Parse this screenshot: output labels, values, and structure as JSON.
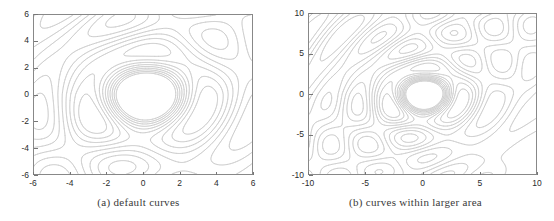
{
  "figure": {
    "background_color": "#ffffff",
    "contour_color": "#c4c4c4",
    "axis_color": "#888888",
    "tick_color": "#777777",
    "text_color": "#2b2b2b"
  },
  "panels": [
    {
      "id": "a",
      "caption": "(a) default curves",
      "chart_data": {
        "type": "line",
        "title": "(a) default curves",
        "subtitle": "",
        "plot_kind": "contour",
        "xlabel": "",
        "ylabel": "",
        "xlim": [
          -6,
          6
        ],
        "ylim": [
          -6,
          6
        ],
        "xticks": [
          -6,
          -4,
          -2,
          0,
          2,
          4,
          6
        ],
        "yticks": [
          -6,
          -4,
          -2,
          0,
          2,
          4,
          6
        ],
        "xtick_labels": [
          "-6",
          "-4",
          "-2",
          "0",
          "2",
          "4",
          "6"
        ],
        "ytick_labels": [
          "-6",
          "-4",
          "-2",
          "0",
          "2",
          "4",
          "6"
        ],
        "grid": false,
        "legend": false,
        "legend_position": "none",
        "n_contour_levels": 10,
        "contour_levels": [
          -0.8,
          -0.6,
          -0.4,
          -0.2,
          0.0,
          0.2,
          0.4,
          0.6,
          0.8,
          1.0
        ],
        "series": [
          {
            "name": "contour lines",
            "values": []
          }
        ],
        "annotations": []
      }
    },
    {
      "id": "b",
      "caption": "(b) curves within larger area",
      "chart_data": {
        "type": "line",
        "title": "(b) curves within larger area",
        "subtitle": "",
        "plot_kind": "contour",
        "xlabel": "",
        "ylabel": "",
        "xlim": [
          -10,
          10
        ],
        "ylim": [
          -10,
          10
        ],
        "xticks": [
          -10,
          -5,
          0,
          5,
          10
        ],
        "yticks": [
          -10,
          -5,
          0,
          5,
          10
        ],
        "xtick_labels": [
          "-10",
          "-5",
          "0",
          "5",
          "10"
        ],
        "ytick_labels": [
          "-10",
          "-5",
          "0",
          "5",
          "10"
        ],
        "grid": false,
        "legend": false,
        "legend_position": "none",
        "n_contour_levels": 10,
        "contour_levels": [
          -0.8,
          -0.6,
          -0.4,
          -0.2,
          0.0,
          0.2,
          0.4,
          0.6,
          0.8,
          1.0
        ],
        "series": [
          {
            "name": "contour lines",
            "values": []
          }
        ],
        "annotations": []
      }
    }
  ]
}
